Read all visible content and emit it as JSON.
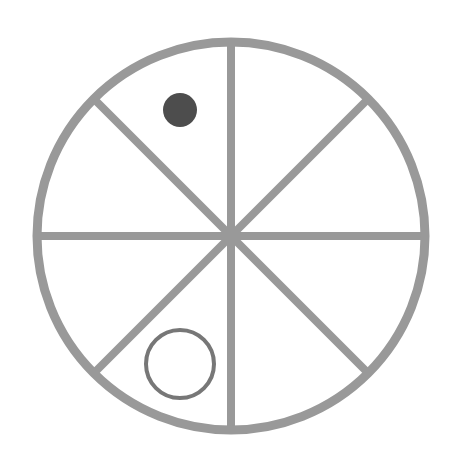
{
  "diagram": {
    "type": "divided-circle",
    "title": "",
    "segments": 8,
    "colors": {
      "background": "#ffffff",
      "outline": "#999999",
      "filled_dot": "#4d4d4d",
      "hollow_ring": "#777777"
    },
    "circle": {
      "cx": 231,
      "cy": 236,
      "r": 194,
      "stroke_width": 9
    },
    "markers": [
      {
        "kind": "filled-dot",
        "sector": "upper-left (top-left of vertical axis)",
        "cx": 180,
        "cy": 110,
        "r": 17
      },
      {
        "kind": "hollow-ring",
        "sector": "lower-left (bottom-left of vertical axis)",
        "cx": 180,
        "cy": 364,
        "r": 34
      }
    ]
  }
}
